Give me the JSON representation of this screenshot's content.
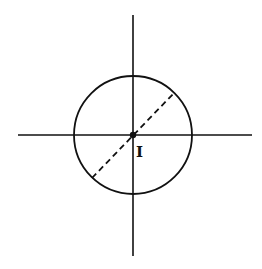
{
  "diagram": {
    "center_label": "I",
    "colors": {
      "stroke": "#111111",
      "background": "#ffffff"
    },
    "center": {
      "x": 133,
      "y": 135
    },
    "circle_radius": 59,
    "vertical_axis": {
      "x": 133,
      "y1": 15,
      "y2": 256
    },
    "horizontal_axis": {
      "y": 135,
      "x1": 18,
      "x2": 252
    },
    "dashed_diameter": {
      "x1": 92,
      "y1": 178,
      "x2": 174,
      "y2": 93
    }
  }
}
